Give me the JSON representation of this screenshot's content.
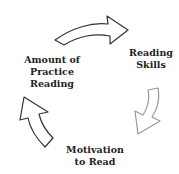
{
  "diagram": {
    "type": "cycle",
    "nodes": [
      {
        "id": "amount",
        "lines": [
          "Amount of",
          "Practice",
          "Reading"
        ]
      },
      {
        "id": "skills",
        "lines": [
          "Reading",
          "Skills"
        ]
      },
      {
        "id": "motivation",
        "lines": [
          "Motivation",
          "to Read"
        ]
      }
    ],
    "edges": [
      {
        "from": "amount",
        "to": "skills",
        "stroke": "#333333"
      },
      {
        "from": "skills",
        "to": "motivation",
        "stroke": "#999999"
      },
      {
        "from": "motivation",
        "to": "amount",
        "stroke": "#333333"
      }
    ]
  }
}
